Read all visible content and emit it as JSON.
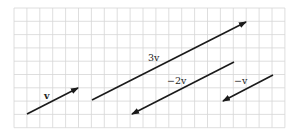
{
  "diagram": {
    "grid": {
      "x0": 14,
      "y0": 8,
      "cols": 21,
      "rows": 9,
      "cell_w": 12.9,
      "cell_h": 13.3,
      "color": "#d6d6d6"
    },
    "stroke_color": "#1a1a1a",
    "vectors": [
      {
        "id": "v",
        "label": "v",
        "x1": 27,
        "y1": 114,
        "x2": 78,
        "y2": 88,
        "label_x": 44,
        "label_y": 99
      },
      {
        "id": "3v",
        "label": "3v",
        "x1": 92,
        "y1": 100,
        "x2": 246,
        "y2": 22,
        "label_x": 148,
        "label_y": 61
      },
      {
        "id": "-2v",
        "label": "−2v",
        "x1": 234,
        "y1": 62,
        "x2": 132,
        "y2": 114,
        "label_x": 167,
        "label_y": 84
      },
      {
        "id": "-v",
        "label": "−v",
        "x1": 273,
        "y1": 75,
        "x2": 223,
        "y2": 101,
        "label_x": 234,
        "label_y": 84
      }
    ]
  }
}
